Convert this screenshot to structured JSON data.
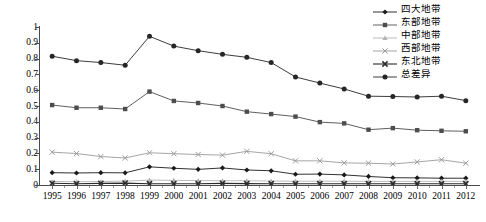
{
  "chart_data": {
    "type": "line",
    "title": "",
    "xlabel": "",
    "ylabel": "",
    "ylim": [
      0,
      1
    ],
    "ytick_labels": [
      "1",
      "0.9",
      "0.8",
      "0.7",
      "0.6",
      "0.5",
      "0.4",
      "0.3",
      "0.2",
      "0.1",
      "0"
    ],
    "ytick_values": [
      1,
      0.9,
      0.8,
      0.7,
      0.6,
      0.5,
      0.4,
      0.3,
      0.2,
      0.1,
      0
    ],
    "grid": false,
    "legend_position": "top-right",
    "categories": [
      "1995",
      "1996",
      "1997",
      "1998",
      "1999",
      "2000",
      "2001",
      "2002",
      "2003",
      "2004",
      "2005",
      "2006",
      "2007",
      "2008",
      "2009",
      "2010",
      "2011",
      "2012"
    ],
    "series": [
      {
        "name": "四大地带",
        "marker": "diamond",
        "color": "#1a1a1a",
        "values": [
          0.078,
          0.076,
          0.078,
          0.077,
          0.115,
          0.106,
          0.099,
          0.108,
          0.095,
          0.09,
          0.068,
          0.069,
          0.064,
          0.054,
          0.046,
          0.045,
          0.043,
          0.043
        ]
      },
      {
        "name": "东部地带",
        "marker": "square",
        "color": "#4d4d4d",
        "values": [
          0.506,
          0.489,
          0.489,
          0.481,
          0.591,
          0.532,
          0.519,
          0.5,
          0.464,
          0.449,
          0.433,
          0.398,
          0.39,
          0.35,
          0.36,
          0.347,
          0.343,
          0.34
        ]
      },
      {
        "name": "中部地带",
        "marker": "triangle",
        "color": "#b3b3b3",
        "values": [
          0.022,
          0.021,
          0.022,
          0.025,
          0.031,
          0.029,
          0.028,
          0.027,
          0.027,
          0.025,
          0.024,
          0.024,
          0.024,
          0.023,
          0.023,
          0.023,
          0.023,
          0.023
        ]
      },
      {
        "name": "西部地带",
        "marker": "cross",
        "color": "#9b9b9b",
        "values": [
          0.208,
          0.199,
          0.18,
          0.171,
          0.204,
          0.198,
          0.193,
          0.189,
          0.213,
          0.198,
          0.153,
          0.153,
          0.14,
          0.138,
          0.133,
          0.146,
          0.16,
          0.138
        ]
      },
      {
        "name": "东北地带",
        "marker": "cross-bold",
        "color": "#2b2b2b",
        "values": [
          0.011,
          0.008,
          0.01,
          0.012,
          0.008,
          0.008,
          0.008,
          0.01,
          0.009,
          0.008,
          0.008,
          0.008,
          0.008,
          0.008,
          0.008,
          0.008,
          0.008,
          0.008
        ]
      },
      {
        "name": "总差异",
        "marker": "circle",
        "color": "#262626",
        "values": [
          0.815,
          0.787,
          0.775,
          0.758,
          0.941,
          0.879,
          0.85,
          0.827,
          0.808,
          0.775,
          0.684,
          0.645,
          0.608,
          0.562,
          0.56,
          0.557,
          0.562,
          0.534
        ]
      }
    ]
  },
  "legend": {
    "items": [
      {
        "label": "四大地带"
      },
      {
        "label": "东部地带"
      },
      {
        "label": "中部地带"
      },
      {
        "label": "西部地带"
      },
      {
        "label": "东北地带"
      },
      {
        "label": "总差异"
      }
    ]
  }
}
